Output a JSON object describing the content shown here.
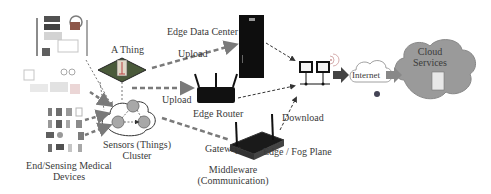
{
  "diagram": {
    "nodes": {
      "medical_devices": {
        "label_line1": "End/Sensing Medical",
        "label_line2": "Devices",
        "icon": "medical-devices-collage"
      },
      "thing": {
        "label": "A Thing",
        "icon": "circuit-board-thing"
      },
      "sensors_cluster": {
        "label_line1": "Sensors (Things)",
        "label_line2": "Cluster",
        "icon": "sensor-cluster-cloud"
      },
      "edge_data_center": {
        "label": "Edge Data Center",
        "icon": "server-rack"
      },
      "edge_router": {
        "label": "Edge Router",
        "icon": "wifi-router"
      },
      "gateway": {
        "label": "Gateway",
        "icon": "gateway-device"
      },
      "middleware": {
        "label_line1": "Middleware",
        "label_line2": "(Communication)"
      },
      "edge_fog_plane": {
        "label": "Edge / Fog Plane",
        "icon": "networked-computers"
      },
      "internet": {
        "label": "Internet",
        "icon": "internet-cloud"
      },
      "cloud": {
        "label_line1": "Cloud",
        "label_line2": "Services",
        "icon": "cloud-server"
      }
    },
    "edges": [
      {
        "from": "thing",
        "to": "edge_data_center",
        "label": "Upload",
        "style": "dashed-thick"
      },
      {
        "from": "thing",
        "to": "edge_router",
        "label": "Upload",
        "style": "dashed-thick"
      },
      {
        "from": "sensors_cluster",
        "to": "gateway",
        "label": "",
        "style": "dashed-thick"
      },
      {
        "from": "edge_data_center",
        "to": "edge_fog_plane",
        "label": "",
        "style": "dashed"
      },
      {
        "from": "edge_router",
        "to": "edge_fog_plane",
        "label": "",
        "style": "dashed"
      },
      {
        "from": "gateway",
        "to": "edge_fog_plane",
        "label": "Download",
        "style": "dashed"
      },
      {
        "from": "edge_fog_plane",
        "to": "internet",
        "label": "",
        "style": "solid-block-arrow"
      },
      {
        "from": "internet",
        "to": "cloud",
        "label": "",
        "style": "solid-block-arrow"
      }
    ],
    "colors": {
      "arrow_gray": "#7a7a7a",
      "cloud_fill": "#9a9a9a",
      "device_black": "#111111",
      "sensor_node": "#a8a8a8",
      "text": "#3a3a3a"
    }
  }
}
